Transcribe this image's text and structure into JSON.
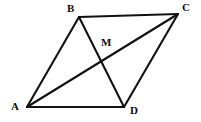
{
  "figure": {
    "kind": "geometry-diagram",
    "width": 201,
    "height": 122,
    "background_color": "#ffffff",
    "stroke_color": "#111111",
    "stroke_width": 2.1,
    "label_color": "#0d0d0d"
  },
  "points": {
    "A": {
      "label": "A",
      "x": 27,
      "y": 107,
      "label_x": 11,
      "label_y": 101
    },
    "B": {
      "label": "B",
      "x": 79,
      "y": 17,
      "label_x": 67,
      "label_y": 3
    },
    "C": {
      "label": "C",
      "x": 178,
      "y": 14,
      "label_x": 182,
      "label_y": 2
    },
    "D": {
      "label": "D",
      "x": 124,
      "y": 107,
      "label_x": 130,
      "label_y": 105
    },
    "M": {
      "label": "M",
      "x": 100,
      "y": 57,
      "label_x": 101,
      "label_y": 37
    }
  },
  "segments": [
    {
      "name": "side-AB",
      "from": "A",
      "to": "B"
    },
    {
      "name": "side-BC",
      "from": "B",
      "to": "C"
    },
    {
      "name": "side-CD",
      "from": "C",
      "to": "D"
    },
    {
      "name": "side-DA",
      "from": "D",
      "to": "A"
    },
    {
      "name": "diagonal-AC",
      "from": "A",
      "to": "C"
    },
    {
      "name": "diagonal-BD",
      "from": "B",
      "to": "D"
    }
  ],
  "labels": {
    "a": "A",
    "b": "B",
    "c": "C",
    "d": "D",
    "m": "M"
  }
}
